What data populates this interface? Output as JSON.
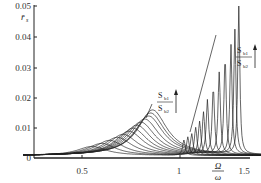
{
  "chart_data": {
    "type": "line",
    "title": "",
    "xlabel": "Ω/ω",
    "ylabel": "r̄_s",
    "xlim": [
      0.2,
      1.5
    ],
    "ylim": [
      0,
      0.05
    ],
    "x_ticks": [
      "0.5",
      "1",
      "1.5"
    ],
    "y_ticks": [
      "0",
      "0.01",
      "0.02",
      "0.03",
      "0.04",
      "0.05"
    ],
    "grid": false,
    "legend": null,
    "annotations": [
      {
        "text": "S_b1 / S_b2",
        "arrow": "up",
        "position": "upper right",
        "near_x": 1.35,
        "near_y": 0.042
      },
      {
        "text": "S_b1 / S_b2",
        "arrow": "up",
        "position": "middle",
        "near_x": 0.93,
        "near_y": 0.025
      }
    ],
    "series": [
      {
        "name": "curve-1",
        "peak_x": 1.02,
        "peak_y": 0.005,
        "low_peak_x": 0.55,
        "low_peak_y": 0.003
      },
      {
        "name": "curve-2",
        "peak_x": 1.04,
        "peak_y": 0.006,
        "low_peak_x": 0.6,
        "low_peak_y": 0.004
      },
      {
        "name": "curve-3",
        "peak_x": 1.06,
        "peak_y": 0.007,
        "low_peak_x": 0.64,
        "low_peak_y": 0.005
      },
      {
        "name": "curve-4",
        "peak_x": 1.08,
        "peak_y": 0.009,
        "low_peak_x": 0.68,
        "low_peak_y": 0.006
      },
      {
        "name": "curve-5",
        "peak_x": 1.1,
        "peak_y": 0.011,
        "low_peak_x": 0.71,
        "low_peak_y": 0.007
      },
      {
        "name": "curve-6",
        "peak_x": 1.12,
        "peak_y": 0.014,
        "low_peak_x": 0.74,
        "low_peak_y": 0.008
      },
      {
        "name": "curve-7",
        "peak_x": 1.14,
        "peak_y": 0.018,
        "low_peak_x": 0.76,
        "low_peak_y": 0.009
      },
      {
        "name": "curve-8",
        "peak_x": 1.17,
        "peak_y": 0.022,
        "low_peak_x": 0.78,
        "low_peak_y": 0.01
      },
      {
        "name": "curve-9",
        "peak_x": 1.2,
        "peak_y": 0.027,
        "low_peak_x": 0.8,
        "low_peak_y": 0.011
      },
      {
        "name": "curve-10",
        "peak_x": 1.23,
        "peak_y": 0.032,
        "low_peak_x": 0.82,
        "low_peak_y": 0.012
      },
      {
        "name": "curve-11",
        "peak_x": 1.26,
        "peak_y": 0.036,
        "low_peak_x": 0.84,
        "low_peak_y": 0.013
      },
      {
        "name": "curve-12",
        "peak_x": 1.28,
        "peak_y": 0.041,
        "low_peak_x": 0.85,
        "low_peak_y": 0.014
      },
      {
        "name": "curve-13",
        "peak_x": 1.3,
        "peak_y": 0.049,
        "low_peak_x": 0.86,
        "low_peak_y": 0.015
      }
    ]
  },
  "axes": {
    "y_label_main": "r̄",
    "y_label_sub": "s",
    "x_label_num": "Ω",
    "x_label_den": "ω",
    "y_ticks": [
      "0.05",
      "0.04",
      "0.03",
      "0.02",
      "0.01",
      "0"
    ],
    "x_ticks": [
      "0.5",
      "1",
      "1.5"
    ]
  },
  "annotations": {
    "ratio_num_main": "S",
    "ratio_num_sub": "b1",
    "ratio_den_main": "S",
    "ratio_den_sub": "b2"
  }
}
